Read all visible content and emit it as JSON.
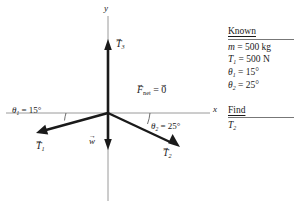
{
  "figure": {
    "axes": {
      "y_label": "y",
      "x_label": "x"
    },
    "vectors": [
      {
        "name": "T3",
        "label_base": "T",
        "label_sub": "3",
        "direction": "up"
      },
      {
        "name": "T1",
        "label_base": "T",
        "label_sub": "1",
        "direction": "down-left"
      },
      {
        "name": "T2",
        "label_base": "T",
        "label_sub": "2",
        "direction": "down-right"
      },
      {
        "name": "w",
        "label_base": "w",
        "label_sub": "",
        "direction": "down"
      }
    ],
    "fnet_label": "F",
    "fnet_sub": "net",
    "fnet_eq": " = ",
    "fnet_zero": "0",
    "angles": [
      {
        "name": "theta1",
        "symbol": "θ",
        "sub": "1",
        "eq": " = ",
        "value": "15°"
      },
      {
        "name": "theta2",
        "symbol": "θ",
        "sub": "2",
        "eq": " = ",
        "value": "25°"
      }
    ]
  },
  "panel": {
    "known_heading": "Known",
    "known_rows": [
      {
        "sym": "m",
        "sub": "",
        "eq": " = ",
        "val": "500 kg"
      },
      {
        "sym": "T",
        "sub": "1",
        "eq": " = ",
        "val": "500 N"
      },
      {
        "sym": "θ",
        "sub": "1",
        "eq": " = ",
        "val": "15°"
      },
      {
        "sym": "θ",
        "sub": "2",
        "eq": " = ",
        "val": "25°"
      }
    ],
    "find_heading": "Find",
    "find_rows": [
      {
        "sym": "T",
        "sub": "2",
        "eq": "",
        "val": ""
      }
    ]
  },
  "colors": {
    "ink": "#1a1a1a",
    "axis": "#9a9a9a",
    "rule": "#777777"
  }
}
